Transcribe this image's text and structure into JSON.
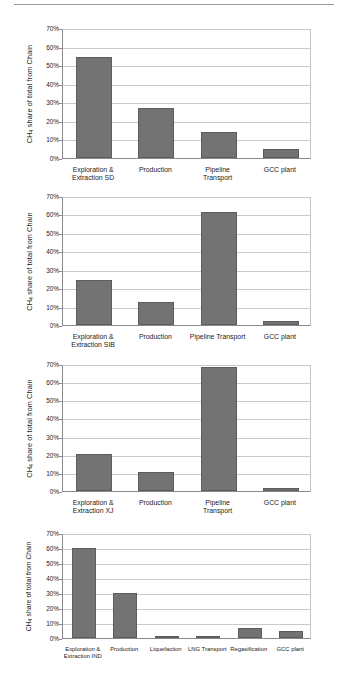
{
  "page": {
    "background_color": "#ffffff",
    "bar_color": "#737373",
    "grid_color": "#c9c9c9",
    "axis_color": "#8a8a8a",
    "top_rule": "horizontal-rule"
  },
  "axis_titles": {
    "y_prefix": "CH",
    "y_sub": "4",
    "y_suffix": " share of total from Chain"
  },
  "y_ticks": [
    "70%",
    "60%",
    "50%",
    "40%",
    "30%",
    "20%",
    "10%",
    "0%"
  ],
  "chart_data": [
    {
      "id": "chart-sd",
      "type": "bar",
      "title": "",
      "xlabel": "",
      "ylabel": "CH4 share of total from Chain",
      "ylim": [
        0,
        70
      ],
      "ytick_values": [
        70,
        60,
        50,
        40,
        30,
        20,
        10,
        0
      ],
      "ytick_labels": [
        "70%",
        "60%",
        "50%",
        "40%",
        "30%",
        "20%",
        "10%",
        "0%"
      ],
      "grid": true,
      "legend": "none",
      "categories": [
        "Exploration & Extraction SD",
        "Production",
        "Pipeline Transport",
        "GCC plant"
      ],
      "category_lines": [
        [
          "Exploration &",
          "Extraction SD"
        ],
        [
          "Production"
        ],
        [
          "Pipeline",
          "Transport"
        ],
        [
          "GCC plant"
        ]
      ],
      "values": [
        54.5,
        27.2,
        13.9,
        5.0
      ]
    },
    {
      "id": "chart-sib",
      "type": "bar",
      "title": "",
      "xlabel": "",
      "ylabel": "CH4 share of total from Chain",
      "ylim": [
        0,
        70
      ],
      "ytick_values": [
        70,
        60,
        50,
        40,
        30,
        20,
        10,
        0
      ],
      "ytick_labels": [
        "70%",
        "60%",
        "50%",
        "40%",
        "30%",
        "20%",
        "10%",
        "0%"
      ],
      "grid": true,
      "legend": "none",
      "categories": [
        "Exploration & Extraction SIB",
        "Production",
        "Pipeline Transport",
        "GCC plant"
      ],
      "category_lines": [
        [
          "Exploration &",
          "Extraction SIB"
        ],
        [
          "Production"
        ],
        [
          "Pipeline Transport"
        ],
        [
          "GCC plant"
        ]
      ],
      "values": [
        24.5,
        12.6,
        61.4,
        2.2
      ]
    },
    {
      "id": "chart-xj",
      "type": "bar",
      "title": "",
      "xlabel": "",
      "ylabel": "CH4 share of total from Chain",
      "ylim": [
        0,
        70
      ],
      "ytick_values": [
        70,
        60,
        50,
        40,
        30,
        20,
        10,
        0
      ],
      "ytick_labels": [
        "70%",
        "60%",
        "50%",
        "40%",
        "30%",
        "20%",
        "10%",
        "0%"
      ],
      "grid": true,
      "legend": "none",
      "categories": [
        "Exploration & Extraction XJ",
        "Production",
        "Pipeline Transport",
        "GCC plant"
      ],
      "category_lines": [
        [
          "Exploration &",
          "Extraction XJ"
        ],
        [
          "Production"
        ],
        [
          "Pipeline",
          "Transport"
        ],
        [
          "GCC plant"
        ]
      ],
      "values": [
        20.2,
        10.3,
        68.6,
        1.7
      ]
    },
    {
      "id": "chart-ind",
      "type": "bar",
      "title": "",
      "xlabel": "",
      "ylabel": "CH4 share of total from Chain",
      "ylim": [
        0,
        70
      ],
      "ytick_values": [
        70,
        60,
        50,
        40,
        30,
        20,
        10,
        0
      ],
      "ytick_labels": [
        "70%",
        "60%",
        "50%",
        "40%",
        "30%",
        "20%",
        "10%",
        "0%"
      ],
      "grid": true,
      "legend": "none",
      "categories": [
        "Exploration & Extraction IND",
        "Production",
        "Liquefaction",
        "LNG Transport",
        "Regasification",
        "GCC plant"
      ],
      "category_lines": [
        [
          "Exploration &",
          "Extraction IND"
        ],
        [
          "Production"
        ],
        [
          "Liquefaction"
        ],
        [
          "LNG Transport"
        ],
        [
          "Regasification"
        ],
        [
          "GCC plant"
        ]
      ],
      "values": [
        60.3,
        29.8,
        0.5,
        0.1,
        6.9,
        4.6
      ]
    }
  ]
}
